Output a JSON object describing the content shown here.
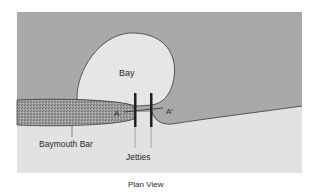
{
  "diagram": {
    "caption": "Plan View",
    "labels": {
      "bay": "Bay",
      "baymouth_bar": "Baymouth Bar",
      "jetties": "Jetties",
      "section_start": "A",
      "section_end": "A′"
    },
    "colors": {
      "ocean": "#a9a9a9",
      "land": "#e2e2e2",
      "bay": "#e6e6e6",
      "bar": "#9a9a9a",
      "line": "#2b2b2b",
      "background": "#ffffff"
    }
  }
}
